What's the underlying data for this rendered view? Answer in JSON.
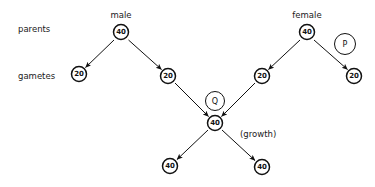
{
  "diagram": {
    "row_labels": {
      "parents": "parents",
      "gametes": "gametes"
    },
    "sex_labels": {
      "male": "male",
      "female": "female"
    },
    "annotations": {
      "growth": "(growth)"
    },
    "process_markers": {
      "p": "P",
      "q": "Q"
    },
    "nodes": {
      "male_parent": "40",
      "female_parent": "40",
      "gamete_1": "20",
      "gamete_2": "20",
      "gamete_3": "20",
      "gamete_4": "20",
      "zygote": "40",
      "offspring_cell_1": "40",
      "offspring_cell_2": "40"
    },
    "colors": {
      "background": "#ffffff",
      "stroke": "#111111",
      "text": "#1a1a1a"
    }
  }
}
